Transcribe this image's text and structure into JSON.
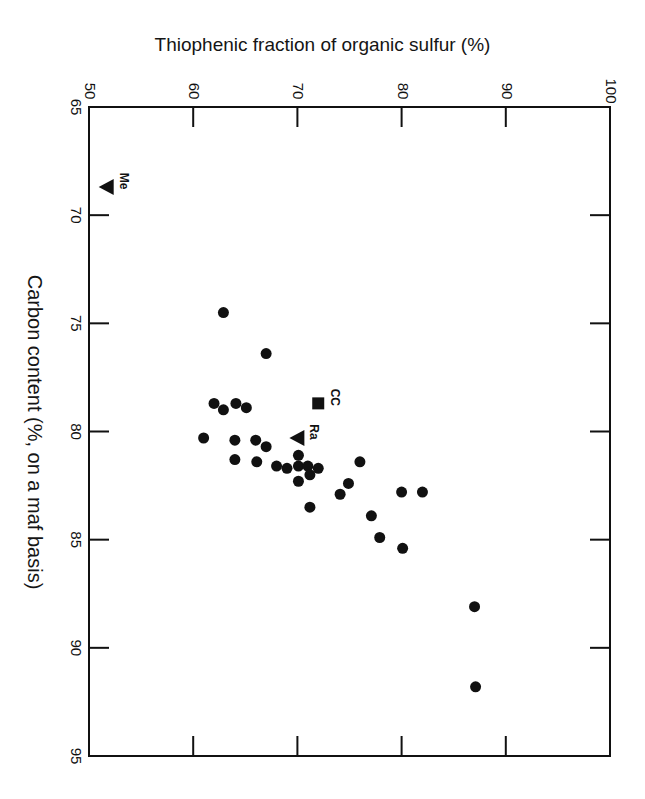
{
  "chart_data": {
    "type": "scatter",
    "title": "",
    "xlabel": "Thiophenic fraction of organic sulfur (%)",
    "ylabel": "Carbon content (%, on a maf basis)",
    "orientation_note": "figure printed rotated 90 degrees clockwise; x axis along top, y axis along left increasing downward",
    "xlim": [
      50,
      100
    ],
    "ylim": [
      65,
      95
    ],
    "x_ticks": [
      50,
      60,
      70,
      80,
      90,
      100
    ],
    "y_ticks": [
      65,
      70,
      75,
      80,
      85,
      90,
      95
    ],
    "grid": false,
    "legend": null,
    "series": [
      {
        "name": "coal samples",
        "marker": "circle",
        "points": [
          [
            62.9,
            74.5
          ],
          [
            67.0,
            76.4
          ],
          [
            62.0,
            78.7
          ],
          [
            62.9,
            79.0
          ],
          [
            64.1,
            78.7
          ],
          [
            65.1,
            78.9
          ],
          [
            61.0,
            80.3
          ],
          [
            64.0,
            80.4
          ],
          [
            66.0,
            80.4
          ],
          [
            67.0,
            80.7
          ],
          [
            64.0,
            81.3
          ],
          [
            66.1,
            81.4
          ],
          [
            68.0,
            81.6
          ],
          [
            69.0,
            81.7
          ],
          [
            70.1,
            81.1
          ],
          [
            70.1,
            81.6
          ],
          [
            70.1,
            82.3
          ],
          [
            71.0,
            81.6
          ],
          [
            72.0,
            81.7
          ],
          [
            71.2,
            82.0
          ],
          [
            76.0,
            81.4
          ],
          [
            74.9,
            82.4
          ],
          [
            74.1,
            82.9
          ],
          [
            71.2,
            83.5
          ],
          [
            80.0,
            82.8
          ],
          [
            82.0,
            82.8
          ],
          [
            77.1,
            83.9
          ],
          [
            77.9,
            84.9
          ],
          [
            80.1,
            85.4
          ],
          [
            87.0,
            88.1
          ],
          [
            87.1,
            91.8
          ]
        ]
      },
      {
        "name": "Me",
        "marker": "triangle-down",
        "label": "Me",
        "points": [
          [
            51.7,
            68.7
          ]
        ]
      },
      {
        "name": "CC",
        "marker": "square",
        "label": "CC",
        "points": [
          [
            72.0,
            78.7
          ]
        ]
      },
      {
        "name": "Ra",
        "marker": "triangle-up",
        "label": "Ra",
        "points": [
          [
            70.0,
            80.3
          ]
        ]
      }
    ]
  },
  "colors": {
    "ink": "#111111",
    "background": "#ffffff"
  }
}
